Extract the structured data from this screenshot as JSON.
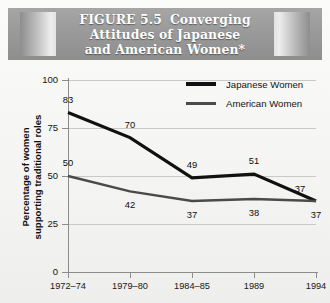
{
  "title": {
    "figure_number": "FIGURE 5.5",
    "line1_rest": "Converging",
    "line2": "Attitudes of Japanese",
    "line3": "and American Women*"
  },
  "legend": {
    "items": [
      {
        "label": "Japanese Women",
        "color": "#111111"
      },
      {
        "label": "American Women",
        "color": "#4a4a4a"
      }
    ]
  },
  "chart_data": {
    "type": "line",
    "xlabel": "",
    "ylabel": "Percentage of women supporting traditional roles",
    "ylabel_line1": "Percentage of women",
    "ylabel_line2": "supporting traditional roles",
    "categories": [
      "1972–74",
      "1979–80",
      "1984–85",
      "1989",
      "1994"
    ],
    "ylim": [
      0,
      100
    ],
    "yticks": [
      0,
      25,
      50,
      75,
      100
    ],
    "ytick_labels": [
      "0",
      "25",
      "50",
      "75",
      "100"
    ],
    "grid": "horizontal",
    "legend_position": "top-right",
    "series": [
      {
        "name": "Japanese Women",
        "color": "#111111",
        "values": [
          83,
          70,
          49,
          51,
          37
        ],
        "labels": [
          "83",
          "70",
          "49",
          "51",
          "37"
        ]
      },
      {
        "name": "American Women",
        "color": "#4a4a4a",
        "values": [
          50,
          42,
          37,
          38,
          37
        ],
        "labels": [
          "50",
          "42",
          "37",
          "38",
          "37"
        ]
      }
    ]
  }
}
